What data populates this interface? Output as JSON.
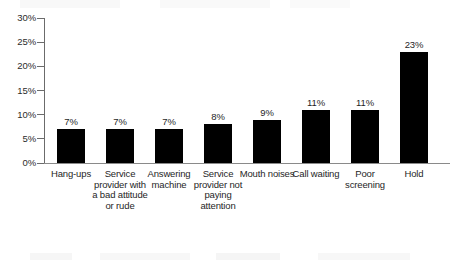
{
  "chart_data": {
    "type": "bar",
    "title": "",
    "subtitle": "",
    "xlabel": "",
    "ylabel": "",
    "categories": [
      "Hang-ups",
      "Service provider with a bad attitude or rude",
      "Answering machine",
      "Service provider not paying attention",
      "Mouth noises",
      "Call waiting",
      "Poor screening",
      "Hold"
    ],
    "values": [
      7,
      7,
      7,
      8,
      9,
      11,
      11,
      23
    ],
    "value_labels": [
      "7%",
      "7%",
      "7%",
      "8%",
      "9%",
      "11%",
      "11%",
      "23%"
    ],
    "ylim": [
      0,
      30
    ],
    "ytick_values": [
      0,
      5,
      10,
      15,
      20,
      25,
      30
    ],
    "ytick_labels": [
      "0%",
      "5%",
      "10%",
      "15%",
      "20%",
      "25%",
      "30%"
    ],
    "grid": false,
    "legend": null,
    "bar_color": "#000000",
    "axis_color": "#6b6b6b",
    "text_color": "#262626"
  }
}
